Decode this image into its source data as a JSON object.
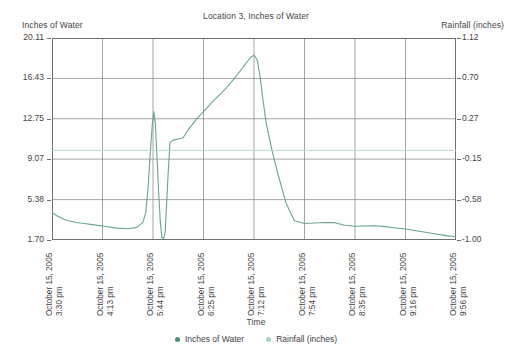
{
  "chart_data": {
    "type": "line",
    "title": "Location 3, Inches of Water",
    "xlabel": "Time",
    "ylabel": "Inches of Water",
    "y2label": "Rainfall (inches)",
    "grid": true,
    "legend_position": "bottom",
    "ylim": [
      1.7,
      20.11
    ],
    "y2lim": [
      -1.0,
      1.12
    ],
    "yticks": [
      "20.11",
      "16.43",
      "12.75",
      "9.07",
      "5.38",
      "1.70"
    ],
    "ytick_values": [
      20.11,
      16.43,
      12.75,
      9.07,
      5.38,
      1.7
    ],
    "y2ticks": [
      "1.12",
      "0.70",
      "0.27",
      "-0.15",
      "-0.58",
      "-1.00"
    ],
    "y2tick_values": [
      1.12,
      0.7,
      0.27,
      -0.15,
      -0.58,
      -1.0
    ],
    "categories": [
      "October 15, 2005 3:30 pm",
      "October 15, 2005 4:13 pm",
      "October 15, 2005 5:44 pm",
      "October 15, 2005 6:25 pm",
      "October 15, 2005 7:12 pm",
      "October 15, 2005 7:54 pm",
      "October 15, 2005 8:35 pm",
      "October 15, 2005 9:16 pm",
      "October 15, 2005 9:56 pm"
    ],
    "xtick_labels": [
      {
        "date": "October 15, 2005",
        "time": "3:30 pm"
      },
      {
        "date": "October 15, 2005",
        "time": "4:13 pm"
      },
      {
        "date": "October 15, 2005",
        "time": "5:44 pm"
      },
      {
        "date": "October 15, 2005",
        "time": "6:25 pm"
      },
      {
        "date": "October 15, 2005",
        "time": "7:12 pm"
      },
      {
        "date": "October 15, 2005",
        "time": "7:54 pm"
      },
      {
        "date": "October 15, 2005",
        "time": "8:35 pm"
      },
      {
        "date": "October 15, 2005",
        "time": "9:16 pm"
      },
      {
        "date": "October 15, 2005",
        "time": "9:56 pm"
      }
    ],
    "series": [
      {
        "name": "Inches of Water",
        "axis": "left",
        "color": "#6aa394",
        "x": [
          0.0,
          0.012,
          0.025,
          0.04,
          0.06,
          0.08,
          0.1,
          0.13,
          0.16,
          0.19,
          0.21,
          0.225,
          0.232,
          0.238,
          0.243,
          0.248,
          0.252,
          0.256,
          0.26,
          0.264,
          0.268,
          0.272,
          0.276,
          0.28,
          0.284,
          0.288,
          0.292,
          0.3,
          0.312,
          0.324,
          0.34,
          0.36,
          0.38,
          0.4,
          0.42,
          0.44,
          0.455,
          0.47,
          0.482,
          0.492,
          0.5,
          0.508,
          0.515,
          0.522,
          0.53,
          0.545,
          0.56,
          0.58,
          0.6,
          0.625,
          0.65,
          0.675,
          0.7,
          0.725,
          0.75,
          0.775,
          0.8,
          0.825,
          0.85,
          0.875,
          0.9,
          0.925,
          0.95,
          0.975,
          1.0
        ],
        "y": [
          4.2,
          3.9,
          3.65,
          3.45,
          3.3,
          3.2,
          3.1,
          2.95,
          2.78,
          2.72,
          2.85,
          3.3,
          4.2,
          6.5,
          9.5,
          12.1,
          13.4,
          12.2,
          9.2,
          6.0,
          3.4,
          1.95,
          1.8,
          2.4,
          5.2,
          8.1,
          10.6,
          10.8,
          10.9,
          11.0,
          11.9,
          12.8,
          13.6,
          14.4,
          15.1,
          15.9,
          16.6,
          17.3,
          17.9,
          18.35,
          18.55,
          18.1,
          16.6,
          14.5,
          12.4,
          9.8,
          7.6,
          5.0,
          3.45,
          3.2,
          3.25,
          3.3,
          3.28,
          3.05,
          2.95,
          2.98,
          3.0,
          2.92,
          2.8,
          2.7,
          2.55,
          2.4,
          2.25,
          2.1,
          2.0
        ]
      },
      {
        "name": "Rainfall (inches)",
        "axis": "right",
        "color": "#b9d8cf",
        "x": [
          0.0,
          0.15,
          0.23,
          0.25,
          0.27,
          0.29,
          0.32,
          0.36,
          0.42,
          0.48,
          0.54,
          0.62,
          0.7,
          0.8,
          0.9,
          1.0
        ],
        "y": [
          -0.06,
          -0.06,
          -0.06,
          -0.06,
          -0.06,
          -0.06,
          -0.06,
          -0.06,
          -0.06,
          -0.06,
          -0.06,
          -0.06,
          -0.06,
          -0.06,
          -0.06,
          -0.06
        ]
      }
    ],
    "legend": [
      {
        "label": "Inches of Water",
        "color": "#4f8c76"
      },
      {
        "label": "Rainfall (inches)",
        "color": "#a6d2c4"
      }
    ]
  }
}
